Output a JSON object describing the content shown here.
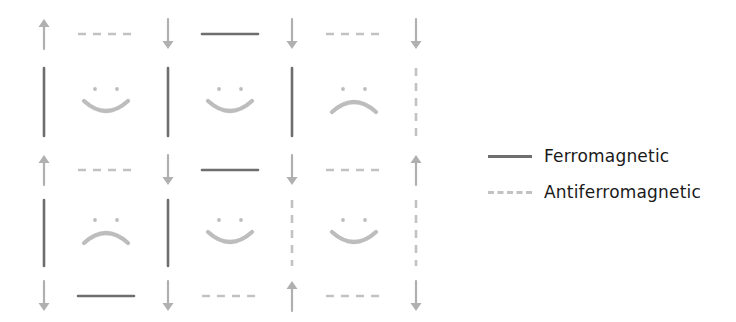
{
  "figure": {
    "background_color": "#ffffff",
    "ferro_color": "#6e6e6e",
    "antiferro_color": "#c2c2c2",
    "spin_color": "#b0b0b0",
    "face_color": "#bdbdbd"
  },
  "legend": {
    "position": "right",
    "entries": [
      {
        "label": "Ferromagnetic",
        "style": "solid",
        "color": "#6e6e6e",
        "icon": "solid-line-icon"
      },
      {
        "label": "Antiferromagnetic",
        "style": "dashed",
        "color": "#c2c2c2",
        "icon": "dashed-line-icon"
      }
    ]
  },
  "chart_data": {
    "type": "diagram",
    "title": "",
    "xlabel": "",
    "ylabel": "",
    "grid": {
      "columns": 4,
      "rows": 3
    },
    "site_positions_x": [
      44,
      168,
      292,
      416
    ],
    "site_positions_y": [
      34,
      170,
      296
    ],
    "spins": [
      [
        "up",
        "down",
        "down",
        "down"
      ],
      [
        "up",
        "down",
        "down",
        "up"
      ],
      [
        "down",
        "down",
        "up",
        "down"
      ]
    ],
    "horizontal_bonds": [
      [
        "antiferromagnetic",
        "ferromagnetic",
        "antiferromagnetic"
      ],
      [
        "antiferromagnetic",
        "ferromagnetic",
        "antiferromagnetic"
      ],
      [
        "ferromagnetic",
        "antiferromagnetic",
        "antiferromagnetic"
      ]
    ],
    "vertical_bonds": [
      [
        "ferromagnetic",
        "ferromagnetic",
        "ferromagnetic",
        "antiferromagnetic"
      ],
      [
        "ferromagnetic",
        "ferromagnetic",
        "antiferromagnetic",
        "antiferromagnetic"
      ]
    ],
    "plaquettes": [
      [
        "smile",
        "smile",
        "frown"
      ],
      [
        "frown",
        "smile",
        "smile"
      ]
    ],
    "legend_entries": [
      "Ferromagnetic",
      "Antiferromagnetic"
    ]
  }
}
